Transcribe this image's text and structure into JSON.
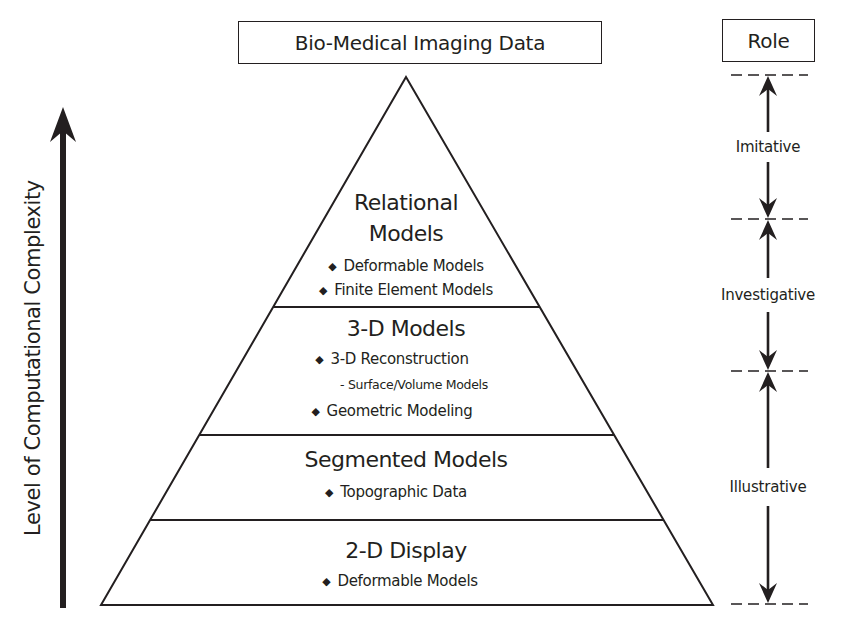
{
  "header": {
    "title": "Bio-Medical Imaging Data",
    "role_header": "Role"
  },
  "axis": {
    "label": "Level of Computational Complexity",
    "direction": "up"
  },
  "pyramid": {
    "tiers": [
      {
        "title_line1": "Relational",
        "title_line2": "Models",
        "items": [
          "Deformable Models",
          "Finite Element Models"
        ]
      },
      {
        "title": "3-D Models",
        "items": [
          "3-D Reconstruction",
          "Geometric Modeling"
        ],
        "subitem": "- Surface/Volume Models"
      },
      {
        "title": "Segmented Models",
        "items": [
          "Topographic Data"
        ]
      },
      {
        "title": "2-D Display",
        "items": [
          "Deformable Models"
        ]
      }
    ]
  },
  "roles": [
    {
      "label": "Imitative"
    },
    {
      "label": "Investigative"
    },
    {
      "label": "Illustrative"
    }
  ],
  "icons": {
    "bullet": "◆"
  },
  "colors": {
    "ink": "#231f20",
    "background": "#ffffff"
  }
}
